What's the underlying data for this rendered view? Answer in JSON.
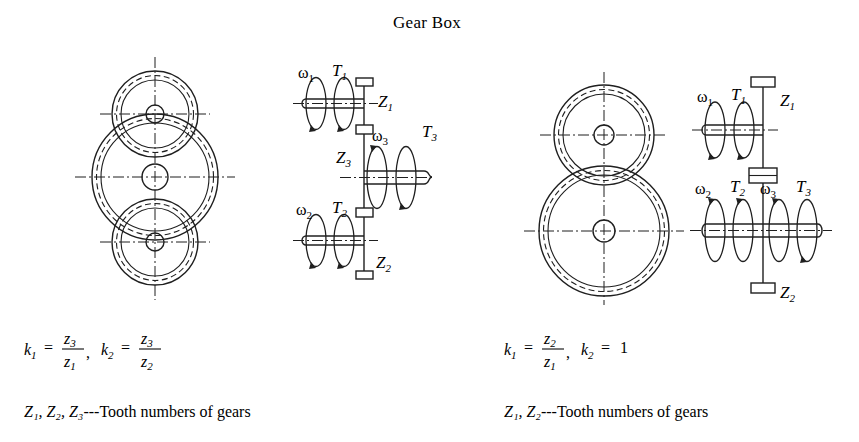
{
  "figure": {
    "title": "Gear Box",
    "background_color": "#ffffff",
    "line_color": "#1f1f1f"
  },
  "left_panel": {
    "name": "three-gear-train",
    "gear_view": {
      "gears": [
        {
          "id": "top",
          "label": "Z1",
          "cx": 155,
          "cy": 114,
          "outer_r": 43,
          "pitch_r": 38,
          "root_r": 34,
          "hub_r": 9
        },
        {
          "id": "middle",
          "label": "Z3",
          "cx": 155,
          "cy": 177,
          "outer_r": 63,
          "pitch_r": 58,
          "root_r": 54,
          "hub_r": 13
        },
        {
          "id": "bottom",
          "label": "Z2",
          "cx": 155,
          "cy": 242,
          "outer_r": 43,
          "pitch_r": 38,
          "root_r": 34,
          "hub_r": 9
        }
      ]
    },
    "schematic": {
      "shaft_gears": [
        {
          "label": "Z1",
          "position": "top"
        },
        {
          "label": "Z3",
          "position": "middle"
        },
        {
          "label": "Z2",
          "position": "bottom"
        }
      ],
      "annotations": [
        {
          "omega": "ω1",
          "torque": "T1",
          "shaft": "upper-left-horizontal"
        },
        {
          "omega": "ω3",
          "torque": "T3",
          "shaft": "middle-right-horizontal"
        },
        {
          "omega": "ω2",
          "torque": "T2",
          "shaft": "lower-left-horizontal"
        }
      ]
    },
    "formula": {
      "k1_label": "k",
      "k1_sub": "1",
      "k1_num": "z",
      "k1_num_sub": "3",
      "k1_den": "z",
      "k1_den_sub": "1",
      "separator": ",",
      "k2_label": "k",
      "k2_sub": "2",
      "k2_num": "z",
      "k2_num_sub": "3",
      "k2_den": "z",
      "k2_den_sub": "2",
      "equals": "="
    },
    "caption": {
      "symbols": "Z₁, Z₂, Z₃",
      "text": "---Tooth numbers of gears"
    }
  },
  "right_panel": {
    "name": "two-gear-train",
    "gear_view": {
      "gears": [
        {
          "id": "top",
          "label": "Z1",
          "cx": 604,
          "cy": 135,
          "outer_r": 50,
          "pitch_r": 45,
          "root_r": 41,
          "hub_r": 10
        },
        {
          "id": "bottom",
          "label": "Z2",
          "cx": 604,
          "cy": 231,
          "outer_r": 65,
          "pitch_r": 60,
          "root_r": 56,
          "hub_r": 11
        }
      ]
    },
    "schematic": {
      "shaft_gears": [
        {
          "label": "Z1",
          "position": "top"
        },
        {
          "label": "",
          "position": "middle"
        },
        {
          "label": "Z2",
          "position": "bottom"
        }
      ],
      "annotations": [
        {
          "omega": "ω1",
          "torque": "T1",
          "shaft": "upper-left-horizontal"
        },
        {
          "omega": "ω2",
          "torque": "T2",
          "shaft": "lower-left-horizontal"
        },
        {
          "omega": "ω3",
          "torque": "T3",
          "shaft": "lower-right-horizontal"
        }
      ]
    },
    "formula": {
      "k1_label": "k",
      "k1_sub": "1",
      "k1_num": "z",
      "k1_num_sub": "2",
      "k1_den": "z",
      "k1_den_sub": "1",
      "separator": ",",
      "k2_label": "k",
      "k2_sub": "2",
      "k2_value": "1",
      "equals": "="
    },
    "caption": {
      "symbols": "Z₁, Z₂",
      "text": "---Tooth numbers of gears"
    }
  }
}
